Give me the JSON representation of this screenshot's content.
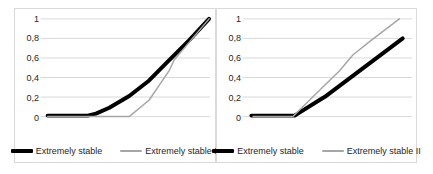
{
  "figure": {
    "background": "#ffffff",
    "panel_border_color": "#d9d9d9",
    "gridline_color": "#d9d9d9",
    "text_color": "#262626"
  },
  "chart_data": [
    {
      "type": "line",
      "title": "",
      "xlabel": "",
      "ylabel": "",
      "xlim": [
        0,
        1
      ],
      "ylim": [
        0,
        1
      ],
      "grid": true,
      "legend_position": "bottom",
      "ytick_values": [
        1,
        0.8,
        0.6,
        0.4,
        0.2,
        0
      ],
      "ytick_labels": [
        "1",
        "0,8",
        "0,6",
        "0,4",
        "0,2",
        "0"
      ],
      "series": [
        {
          "name": "Extremely stable",
          "color": "#000000",
          "stroke_width": 4,
          "points": [
            [
              0.03,
              0.01
            ],
            [
              0.27,
              0.01
            ],
            [
              0.32,
              0.03
            ],
            [
              0.4,
              0.09
            ],
            [
              0.52,
              0.21
            ],
            [
              0.64,
              0.37
            ],
            [
              0.75,
              0.56
            ],
            [
              0.88,
              0.78
            ],
            [
              1.0,
              1.0
            ]
          ]
        },
        {
          "name": "Extremely stable II",
          "color": "#a6a6a6",
          "stroke_width": 1.5,
          "points": [
            [
              0.03,
              0.0
            ],
            [
              0.52,
              0.0
            ],
            [
              0.64,
              0.17
            ],
            [
              0.7,
              0.32
            ],
            [
              0.76,
              0.47
            ],
            [
              0.79,
              0.58
            ],
            [
              0.88,
              0.76
            ],
            [
              1.0,
              1.0
            ]
          ]
        }
      ]
    },
    {
      "type": "line",
      "title": "",
      "xlabel": "",
      "ylabel": "",
      "xlim": [
        0,
        1
      ],
      "ylim": [
        0,
        1
      ],
      "grid": true,
      "legend_position": "bottom",
      "ytick_values": [
        1,
        0.8,
        0.6,
        0.4,
        0.2,
        0
      ],
      "ytick_labels": [
        "1",
        "0,8",
        "0,6",
        "0,4",
        "0,2",
        "0"
      ],
      "series": [
        {
          "name": "Extremely stable",
          "color": "#000000",
          "stroke_width": 4,
          "points": [
            [
              0.04,
              0.01
            ],
            [
              0.3,
              0.01
            ],
            [
              0.45,
              0.17
            ],
            [
              0.48,
              0.2
            ],
            [
              0.95,
              0.8
            ]
          ]
        },
        {
          "name": "Extremely stable II",
          "color": "#a6a6a6",
          "stroke_width": 1.5,
          "points": [
            [
              0.05,
              0.0
            ],
            [
              0.29,
              0.0
            ],
            [
              0.45,
              0.27
            ],
            [
              0.57,
              0.47
            ],
            [
              0.65,
              0.63
            ],
            [
              0.76,
              0.78
            ],
            [
              0.93,
              1.0
            ]
          ]
        }
      ]
    }
  ]
}
